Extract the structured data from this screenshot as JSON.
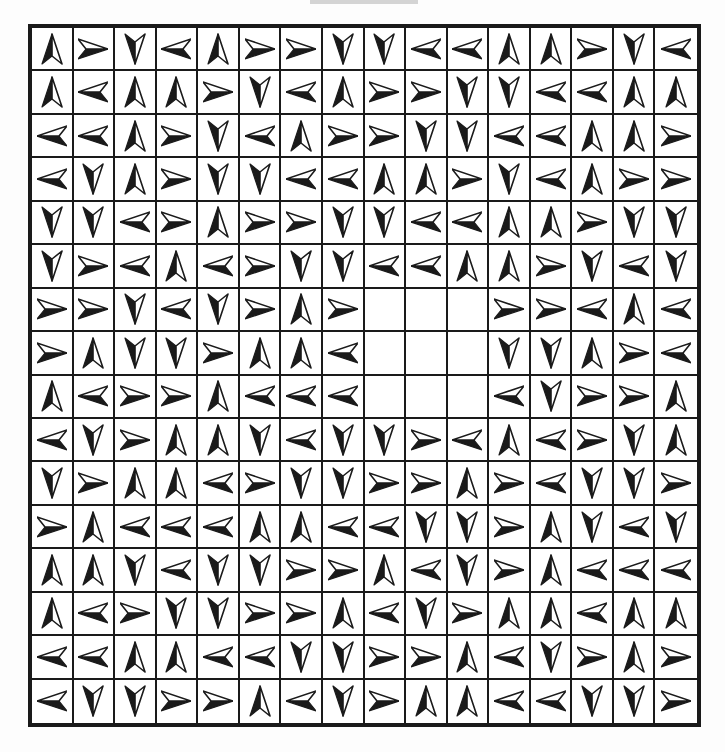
{
  "header": {
    "bar_color": "#d4d4d4"
  },
  "grid": {
    "rows": 16,
    "cols": 16,
    "legend": {
      "U": "up-arrow",
      "D": "down-arrow",
      "L": "left-arrow",
      "R": "right-arrow",
      "E": "empty"
    },
    "cells": [
      [
        "U",
        "R",
        "D",
        "L",
        "U",
        "R",
        "R",
        "D",
        "D",
        "L",
        "L",
        "U",
        "U",
        "R",
        "D",
        "L"
      ],
      [
        "U",
        "L",
        "U",
        "U",
        "R",
        "D",
        "L",
        "U",
        "R",
        "R",
        "D",
        "D",
        "L",
        "L",
        "U",
        "U"
      ],
      [
        "L",
        "L",
        "U",
        "R",
        "D",
        "L",
        "U",
        "R",
        "R",
        "D",
        "D",
        "L",
        "L",
        "U",
        "U",
        "R"
      ],
      [
        "L",
        "D",
        "U",
        "R",
        "D",
        "D",
        "L",
        "L",
        "U",
        "U",
        "R",
        "D",
        "L",
        "U",
        "R",
        "R"
      ],
      [
        "D",
        "D",
        "L",
        "R",
        "U",
        "R",
        "R",
        "D",
        "D",
        "L",
        "L",
        "U",
        "U",
        "R",
        "D",
        "D"
      ],
      [
        "D",
        "R",
        "L",
        "U",
        "L",
        "R",
        "D",
        "D",
        "L",
        "L",
        "U",
        "U",
        "R",
        "D",
        "L",
        "D"
      ],
      [
        "R",
        "R",
        "D",
        "L",
        "D",
        "R",
        "U",
        "R",
        "E",
        "E",
        "E",
        "R",
        "R",
        "L",
        "U",
        "L"
      ],
      [
        "R",
        "U",
        "D",
        "D",
        "R",
        "U",
        "U",
        "L",
        "E",
        "E",
        "E",
        "D",
        "D",
        "U",
        "R",
        "L"
      ],
      [
        "U",
        "L",
        "R",
        "R",
        "U",
        "L",
        "L",
        "L",
        "E",
        "E",
        "E",
        "L",
        "D",
        "R",
        "R",
        "U"
      ],
      [
        "L",
        "D",
        "R",
        "U",
        "U",
        "D",
        "L",
        "D",
        "D",
        "R",
        "L",
        "U",
        "L",
        "R",
        "D",
        "U"
      ],
      [
        "D",
        "R",
        "U",
        "U",
        "L",
        "R",
        "D",
        "D",
        "R",
        "R",
        "U",
        "R",
        "L",
        "D",
        "D",
        "R"
      ],
      [
        "R",
        "U",
        "L",
        "L",
        "L",
        "U",
        "U",
        "L",
        "L",
        "D",
        "D",
        "R",
        "U",
        "D",
        "L",
        "D"
      ],
      [
        "U",
        "U",
        "D",
        "L",
        "D",
        "D",
        "R",
        "R",
        "U",
        "L",
        "D",
        "R",
        "U",
        "L",
        "L",
        "L"
      ],
      [
        "U",
        "L",
        "R",
        "D",
        "D",
        "R",
        "R",
        "U",
        "L",
        "D",
        "R",
        "U",
        "U",
        "L",
        "U",
        "U"
      ],
      [
        "L",
        "L",
        "U",
        "U",
        "L",
        "L",
        "D",
        "D",
        "R",
        "R",
        "U",
        "L",
        "D",
        "R",
        "U",
        "R"
      ],
      [
        "L",
        "D",
        "D",
        "R",
        "R",
        "U",
        "L",
        "D",
        "R",
        "U",
        "U",
        "L",
        "L",
        "D",
        "D",
        "R"
      ]
    ]
  },
  "colors": {
    "ink": "#1a1a1a",
    "paper": "#ffffff"
  }
}
